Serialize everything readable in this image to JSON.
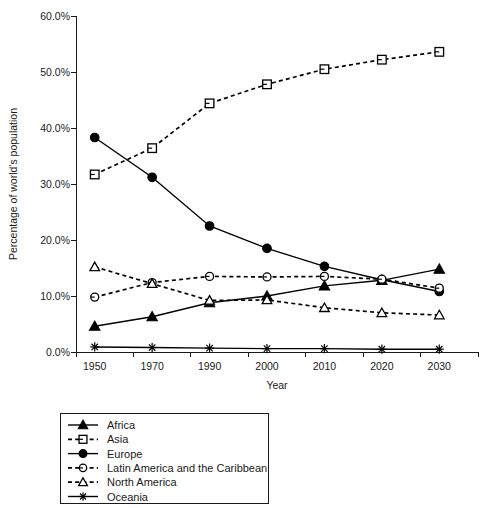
{
  "chart_data": {
    "type": "line",
    "title": "",
    "xlabel": "Year",
    "ylabel": "Percentage of world's population",
    "categories": [
      "1950",
      "1970",
      "1990",
      "2000",
      "2010",
      "2020",
      "2030"
    ],
    "ylim": [
      0,
      60
    ],
    "ytick_values": [
      0,
      10,
      20,
      30,
      40,
      50,
      60
    ],
    "ytick_labels": [
      "0.0%",
      "10.0%",
      "20.0%",
      "30.0%",
      "40.0%",
      "50.0%",
      "60.0%"
    ],
    "grid": false,
    "legend_position": "below-plot",
    "series": [
      {
        "name": "Africa",
        "marker": "triangle-filled",
        "line_style": "solid",
        "color": "#000000",
        "values": [
          4.6,
          6.3,
          8.8,
          10.0,
          11.8,
          12.8,
          14.8
        ]
      },
      {
        "name": "Asia",
        "marker": "square-open",
        "line_style": "dashed",
        "color": "#000000",
        "values": [
          31.7,
          36.4,
          44.4,
          47.8,
          50.5,
          52.2,
          53.6
        ]
      },
      {
        "name": "Europe",
        "marker": "circle-filled",
        "line_style": "solid",
        "color": "#000000",
        "values": [
          38.3,
          31.2,
          22.5,
          18.5,
          15.3,
          12.9,
          10.8
        ]
      },
      {
        "name": "Latin America and the Caribbean",
        "marker": "circle-open",
        "line_style": "dashed",
        "color": "#000000",
        "values": [
          9.8,
          12.4,
          13.5,
          13.4,
          13.5,
          13.0,
          11.4
        ]
      },
      {
        "name": "North America",
        "marker": "triangle-open",
        "line_style": "dashed",
        "color": "#000000",
        "values": [
          15.2,
          12.2,
          9.2,
          9.3,
          7.9,
          7.0,
          6.6
        ]
      },
      {
        "name": "Oceania",
        "marker": "star",
        "line_style": "solid",
        "color": "#000000",
        "values": [
          0.9,
          0.8,
          0.7,
          0.6,
          0.6,
          0.5,
          0.5
        ]
      }
    ]
  },
  "axes": {
    "x_title": "Year",
    "y_title": "Percentage of world's population"
  }
}
